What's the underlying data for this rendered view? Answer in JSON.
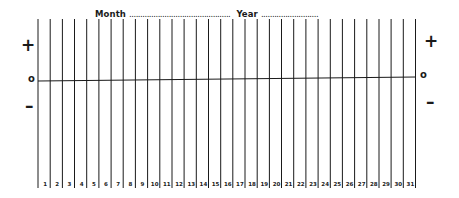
{
  "header": {
    "month_label": "Month",
    "month_value": "..............................................",
    "year_label": "Year",
    "year_value": ".........................."
  },
  "axis": {
    "left": {
      "plus": "+",
      "zero": "o",
      "minus": "–"
    },
    "right": {
      "plus": "+",
      "zero": "o",
      "minus": "–"
    }
  },
  "days": [
    "1",
    "2",
    "3",
    "4",
    "5",
    "6",
    "7",
    "8",
    "9",
    "10",
    "11",
    "12",
    "13",
    "14",
    "15",
    "16",
    "17",
    "18",
    "19",
    "20",
    "21",
    "22",
    "23",
    "24",
    "25",
    "26",
    "27",
    "28",
    "29",
    "30",
    "31"
  ],
  "colors": {
    "ink": "#1a1a1a",
    "paper": "#ffffff"
  }
}
